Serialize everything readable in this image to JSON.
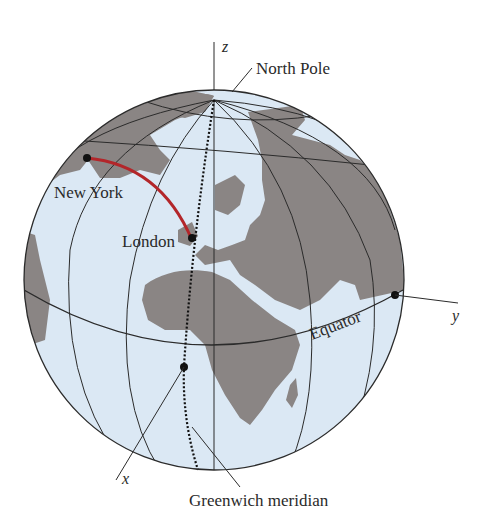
{
  "figure": {
    "type": "globe-diagram",
    "colors": {
      "ocean": "#dbe8f4",
      "land": "#8a8584",
      "grid": "#2b2b2b",
      "route": "#b3262a",
      "point": "#111111"
    }
  },
  "labels": {
    "z_axis": "z",
    "y_axis": "y",
    "x_axis": "x",
    "north_pole": "North Pole",
    "new_york": "New York",
    "london": "London",
    "equator": "Equator",
    "greenwich": "Greenwich meridian"
  }
}
